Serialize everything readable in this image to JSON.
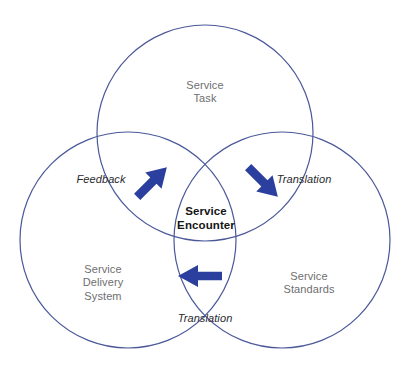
{
  "diagram": {
    "colors": {
      "circle_stroke": "#4a5899",
      "arrow_fill": "#2b3f9e",
      "category_text": "#6e6e70",
      "center_text": "#151515",
      "flow_text": "#2a2a2e",
      "background": "#ffffff"
    },
    "circles": [
      {
        "name": "service-task",
        "cx": 205,
        "cy": 133,
        "r": 108
      },
      {
        "name": "service-delivery-system",
        "cx": 128,
        "cy": 240,
        "r": 108
      },
      {
        "name": "service-standards",
        "cx": 282,
        "cy": 240,
        "r": 108
      }
    ],
    "labels": {
      "top_circle": "Service\nTask",
      "left_circle": "Service\nDelivery\nSystem",
      "right_circle": "Service\nStandards",
      "center": "Service\nEncounter",
      "flow_left": "Feedback",
      "flow_right": "Translation",
      "flow_bottom": "Translation"
    },
    "arrows": [
      {
        "name": "feedback-arrow",
        "direction": "up-right",
        "label": "Feedback"
      },
      {
        "name": "translation-right-arrow",
        "direction": "down-right",
        "label": "Translation"
      },
      {
        "name": "translation-bottom-arrow",
        "direction": "left",
        "label": "Translation"
      }
    ]
  }
}
